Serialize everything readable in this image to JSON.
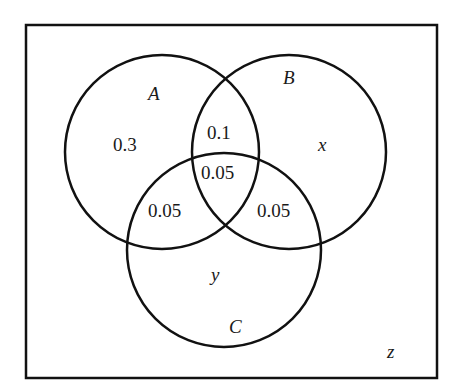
{
  "diagram": {
    "type": "venn",
    "universe": {
      "label": "z"
    },
    "sets": [
      {
        "name": "A",
        "label": "A"
      },
      {
        "name": "B",
        "label": "B"
      },
      {
        "name": "C",
        "label": "C"
      }
    ],
    "regions": {
      "A_only": "0.3",
      "B_only": "x",
      "C_only": "y",
      "A_and_B_only": "0.1",
      "A_and_C_only": "0.05",
      "B_and_C_only": "0.05",
      "A_and_B_and_C": "0.05",
      "outside": "z"
    },
    "colors": {
      "stroke": "#111111",
      "background": "#ffffff"
    }
  }
}
